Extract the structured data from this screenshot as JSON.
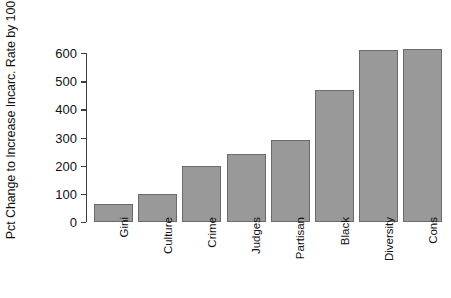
{
  "chart_data": {
    "type": "bar",
    "title": "",
    "xlabel": "",
    "ylabel": "Pct Change to Increase Incarc. Rate by 100",
    "categories": [
      "Gini",
      "Culture",
      "Crime",
      "Judges",
      "Partisan",
      "Black",
      "Diversity",
      "Cons"
    ],
    "values": [
      65,
      100,
      200,
      240,
      290,
      470,
      610,
      615
    ],
    "ytick_labels": [
      "0",
      "100",
      "200",
      "300",
      "400",
      "500",
      "600"
    ],
    "yticks": [
      0,
      100,
      200,
      300,
      400,
      500,
      600
    ],
    "ylim": [
      0,
      615
    ],
    "grid": false,
    "legend": null,
    "bar_color": "#999999",
    "bar_edge_color": "#6a6a6a",
    "axis_color": "#3d3d3d",
    "background": "#ffffff"
  },
  "caption": {
    "fragment": ""
  }
}
